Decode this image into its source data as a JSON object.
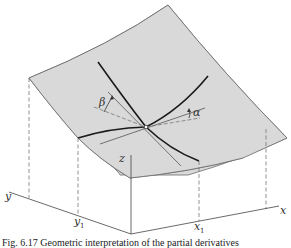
{
  "figure": {
    "colors": {
      "surface_fill": "#d9d9d9",
      "surface_edge": "#666666",
      "trace_curve": "#1a1a1a",
      "tangent_line": "#555555",
      "dashed_guide": "#777777",
      "axis": "#444444",
      "background": "#ffffff"
    },
    "labels": {
      "axis_x": "x",
      "axis_y": "y",
      "axis_z": "z",
      "x1_main": "x",
      "x1_sub": "1",
      "y1_main": "y",
      "y1_sub": "1",
      "angle_alpha": "α",
      "angle_beta": "β"
    },
    "caption_partial": "Fig. 6.17 Geometric interpretation of the partial derivatives"
  }
}
